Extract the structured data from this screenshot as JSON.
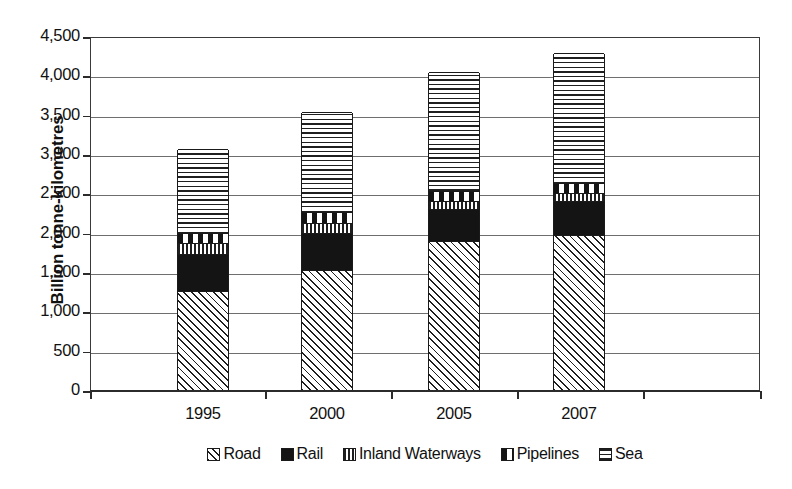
{
  "chart": {
    "type": "bar",
    "title": "",
    "ylabel": "Billion tonne-kilometres",
    "xlabel": ""
  },
  "y_axis": {
    "label": "Billion tonne-kilometres",
    "ticks": [
      "4,500",
      "4,000",
      "3,500",
      "3,000",
      "2,500",
      "2,000",
      "1,500",
      "1,000",
      "500",
      "0"
    ],
    "min": 0,
    "max": 4500,
    "step": 500
  },
  "x_axis": {
    "ticks": [
      "1995",
      "2000",
      "2005",
      "2007"
    ]
  },
  "legend": {
    "position": "bottom",
    "items": [
      {
        "label": "Road",
        "pattern": "diagonal-hatch",
        "color": "#ffffff"
      },
      {
        "label": "Rail",
        "pattern": "solid-black",
        "color": "#141414"
      },
      {
        "label": "Inland Waterways",
        "pattern": "vertical-lines",
        "color": "#ffffff"
      },
      {
        "label": "Pipelines",
        "pattern": "checkerboard",
        "color": "#ffffff"
      },
      {
        "label": "Sea",
        "pattern": "horizontal-lines",
        "color": "#ffffff"
      }
    ]
  },
  "chart_data": {
    "type": "bar",
    "stacked": true,
    "title": "",
    "xlabel": "",
    "ylabel": "Billion tonne-kilometres",
    "ylim": [
      0,
      4500
    ],
    "ytick_step": 500,
    "grid": true,
    "legend_position": "bottom",
    "categories": [
      "1995",
      "2000",
      "2005",
      "2007"
    ],
    "series": [
      {
        "name": "Road",
        "values": [
          1260,
          1530,
          1890,
          1970
        ]
      },
      {
        "name": "Rail",
        "values": [
          470,
          470,
          410,
          430
        ]
      },
      {
        "name": "Inland Waterways",
        "values": [
          140,
          120,
          100,
          100
        ]
      },
      {
        "name": "Pipelines",
        "values": [
          120,
          140,
          130,
          130
        ]
      },
      {
        "name": "Sea",
        "values": [
          1070,
          1280,
          1510,
          1650
        ]
      }
    ],
    "totals": [
      3060,
      3540,
      4040,
      4280
    ]
  }
}
